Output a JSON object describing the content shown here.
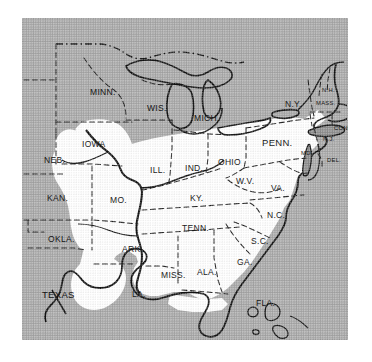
{
  "figure": {
    "name": "eastern-united-states-distribution-map",
    "plate_background_color": "#a9a9a9",
    "land_fill_color": "#ffffff",
    "outline_color": "#111111",
    "border_style_internal": "dashed",
    "frame": {
      "left": 22,
      "top": 18,
      "width": 326,
      "height": 322
    }
  },
  "legend_note": "",
  "states": [
    {
      "id": "minn",
      "label": "MINN.",
      "x": 68,
      "y": 70,
      "size": "lbl-md",
      "on_shade": true
    },
    {
      "id": "wis",
      "label": "WIS.",
      "x": 125,
      "y": 86,
      "size": "lbl-md",
      "on_shade": true
    },
    {
      "id": "mich",
      "label": "MICH.",
      "x": 172,
      "y": 96,
      "size": "lbl-md",
      "on_shade": true
    },
    {
      "id": "iowa",
      "label": "IOWA",
      "x": 60,
      "y": 122,
      "size": "lbl-md",
      "on_shade": false
    },
    {
      "id": "neb",
      "label": "NEB.",
      "x": 22,
      "y": 138,
      "size": "lbl-md",
      "on_shade": true
    },
    {
      "id": "ill",
      "label": "ILL.",
      "x": 128,
      "y": 148,
      "size": "lbl-md",
      "on_shade": false
    },
    {
      "id": "ind",
      "label": "IND.",
      "x": 163,
      "y": 146,
      "size": "lbl-md",
      "on_shade": false
    },
    {
      "id": "ohio",
      "label": "OHIO",
      "x": 196,
      "y": 140,
      "size": "lbl-md",
      "on_shade": false
    },
    {
      "id": "penn",
      "label": "PENN.",
      "x": 240,
      "y": 120,
      "size": "lbl-lg",
      "on_shade": false
    },
    {
      "id": "ny",
      "label": "N.Y.",
      "x": 263,
      "y": 82,
      "size": "lbl-md",
      "on_shade": false
    },
    {
      "id": "nh",
      "label": "N.H.",
      "x": 300,
      "y": 70,
      "size": "lbl-xs",
      "on_shade": false
    },
    {
      "id": "mass",
      "label": "MASS.",
      "x": 294,
      "y": 83,
      "size": "lbl-xs",
      "on_shade": false
    },
    {
      "id": "ri",
      "label": "R.I.",
      "x": 330,
      "y": 96,
      "size": "lbl-xs",
      "on_shade": true
    },
    {
      "id": "conn",
      "label": "CONN.",
      "x": 312,
      "y": 108,
      "size": "lbl-xs",
      "on_shade": true
    },
    {
      "id": "nj",
      "label": "N.J.",
      "x": 301,
      "y": 119,
      "size": "lbl-xs",
      "on_shade": true
    },
    {
      "id": "md",
      "label": "MD.",
      "x": 279,
      "y": 133,
      "size": "lbl-xs",
      "on_shade": false
    },
    {
      "id": "del",
      "label": "DEL.",
      "x": 305,
      "y": 140,
      "size": "lbl-xs",
      "on_shade": true
    },
    {
      "id": "wv",
      "label": "W.V.",
      "x": 214,
      "y": 159,
      "size": "lbl-md",
      "on_shade": false
    },
    {
      "id": "va",
      "label": "VA.",
      "x": 249,
      "y": 166,
      "size": "lbl-md",
      "on_shade": false
    },
    {
      "id": "kan",
      "label": "KAN.",
      "x": 25,
      "y": 176,
      "size": "lbl-md",
      "on_shade": true
    },
    {
      "id": "mo",
      "label": "MO.",
      "x": 88,
      "y": 178,
      "size": "lbl-md",
      "on_shade": false
    },
    {
      "id": "ky",
      "label": "KY.",
      "x": 168,
      "y": 176,
      "size": "lbl-md",
      "on_shade": false
    },
    {
      "id": "nc",
      "label": "N.C.",
      "x": 245,
      "y": 193,
      "size": "lbl-md",
      "on_shade": false
    },
    {
      "id": "tenn",
      "label": "TENN.",
      "x": 160,
      "y": 206,
      "size": "lbl-md",
      "on_shade": false
    },
    {
      "id": "okla",
      "label": "OKLA.",
      "x": 26,
      "y": 217,
      "size": "lbl-md",
      "on_shade": true
    },
    {
      "id": "ark",
      "label": "ARK.",
      "x": 100,
      "y": 227,
      "size": "lbl-md",
      "on_shade": false
    },
    {
      "id": "sc",
      "label": "S.C.",
      "x": 229,
      "y": 219,
      "size": "lbl-md",
      "on_shade": false
    },
    {
      "id": "miss",
      "label": "MISS.",
      "x": 139,
      "y": 253,
      "size": "lbl-md",
      "on_shade": false
    },
    {
      "id": "ala",
      "label": "ALA.",
      "x": 175,
      "y": 250,
      "size": "lbl-md",
      "on_shade": false
    },
    {
      "id": "ga",
      "label": "GA.",
      "x": 215,
      "y": 240,
      "size": "lbl-md",
      "on_shade": false
    },
    {
      "id": "texas",
      "label": "TEXAS",
      "x": 20,
      "y": 272,
      "size": "lbl-lg",
      "on_shade": true
    },
    {
      "id": "la",
      "label": "LA.",
      "x": 110,
      "y": 272,
      "size": "lbl-md",
      "on_shade": false
    },
    {
      "id": "fla",
      "label": "FLA.",
      "x": 234,
      "y": 281,
      "size": "lbl-md",
      "on_shade": true
    }
  ]
}
